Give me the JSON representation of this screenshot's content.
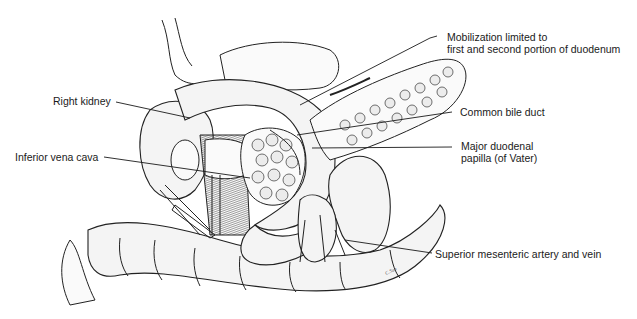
{
  "figure": {
    "labels": {
      "mobilization": [
        "Mobilization limited to",
        "first and second portion of duodenum"
      ],
      "right_kidney": "Right kidney",
      "common_bile_duct": "Common bile duct",
      "inferior_vena_cava": "Inferior vena cava",
      "major_papilla": [
        "Major duodenal",
        "papilla (of Vater)"
      ],
      "sma_smv": "Superior mesenteric artery and vein"
    },
    "artist_signature": "signature"
  },
  "colors": {
    "ink": "#1a1a1a",
    "background": "#ffffff"
  }
}
